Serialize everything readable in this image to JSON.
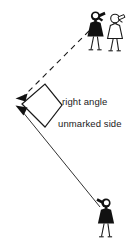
{
  "diagram": {
    "background_color": "#ffffff",
    "line_color": "#1a1a1a",
    "figure_fill_dark": "#111111",
    "figure_fill_light": "#ffffff",
    "labels": {
      "right_angle": "right angle",
      "unmarked_side": "unmarked side"
    },
    "annotations": [
      {
        "name": "right-angle-marker",
        "kind": "square-marker",
        "description": "rotated square marking a 90 degree angle at the left vertex"
      },
      {
        "name": "dashed-sight-line",
        "kind": "dashed-line-with-arrow",
        "description": "dashed line from the upper pair of figures down-left to an arrowhead"
      },
      {
        "name": "solid-sight-line",
        "kind": "solid-line-with-arrow",
        "description": "solid line from the lower figure up-left to an arrowhead"
      }
    ],
    "figures": [
      {
        "name": "figure-top-dark",
        "style": "filled",
        "holding": "camera"
      },
      {
        "name": "figure-top-light",
        "style": "outlined",
        "holding": "camera"
      },
      {
        "name": "figure-bottom-dark",
        "style": "filled",
        "holding": "camera"
      }
    ],
    "geometry": {
      "vertex": [
        17,
        103
      ],
      "dashed_endpoint": [
        90,
        30
      ],
      "solid_endpoint": [
        101,
        206
      ],
      "marker_points": "22,104 45,84 62,105 45,127"
    }
  }
}
